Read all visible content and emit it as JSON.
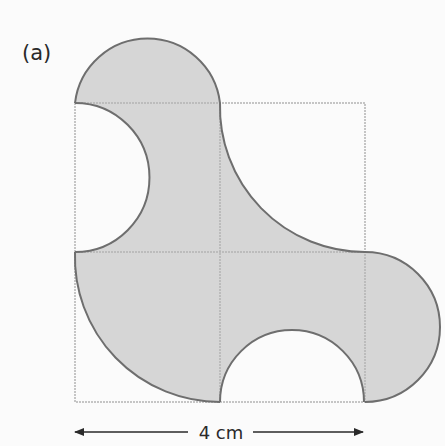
{
  "figure": {
    "part_label": "(a)",
    "dimension_label": "4 cm",
    "colors": {
      "background": "#fbfbfb",
      "shaded_fill": "#d6d6d6",
      "outline": "#6e6e6e",
      "grid_line": "#b4b4b4",
      "text": "#2a2a2a",
      "arrow": "#2a2a2a"
    },
    "square": {
      "side_cm": 4,
      "grid": "2x2"
    }
  }
}
